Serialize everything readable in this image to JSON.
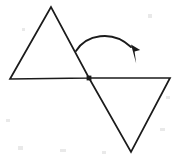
{
  "figure": {
    "background_color": "#ffffff",
    "ink_color": "#1b1b1b",
    "width": 177,
    "height": 161,
    "caption": "Two congruent triangles joined at a common vertex, with a curved arrow indicating a rotation from the upper-left triangle to the lower-right triangle.",
    "shapes": [
      {
        "name": "upper-left-triangle",
        "role": "pre-image",
        "orientation": "point-up",
        "vertices": [
          [
            51,
            7
          ],
          [
            10,
            79
          ],
          [
            89,
            78
          ]
        ],
        "path": "M 51 7 L 10 79 L 89 78 Z"
      },
      {
        "name": "lower-right-triangle",
        "role": "image",
        "orientation": "point-down",
        "vertices": [
          [
            89,
            78
          ],
          [
            170,
            78
          ],
          [
            131,
            152
          ]
        ],
        "path": "M 89 78 L 170 78 L 131 152 Z"
      }
    ],
    "pivot": {
      "name": "pivot-point",
      "label": "",
      "x": 89,
      "y": 78,
      "radius": 2.4,
      "shape": "square-dot"
    },
    "arrow": {
      "name": "rotation-arrow",
      "direction": "clockwise",
      "tail": [
        76,
        51
      ],
      "peak": [
        110,
        33
      ],
      "tip": [
        136,
        63
      ],
      "curve_path": "M 76 51 C 86 35, 112 29, 131 47",
      "head_path": "M 131.0 44.5 L 140.2 50.0 L 134.6 51.6 L 136.2 63.5 Z"
    },
    "specks": [
      {
        "x": 18,
        "y": 146,
        "w": 5,
        "h": 4
      },
      {
        "x": 60,
        "y": 149,
        "w": 6,
        "h": 3
      },
      {
        "x": 102,
        "y": 151,
        "w": 4,
        "h": 3
      },
      {
        "x": 6,
        "y": 119,
        "w": 4,
        "h": 3
      },
      {
        "x": 160,
        "y": 128,
        "w": 5,
        "h": 3
      },
      {
        "x": 148,
        "y": 14,
        "w": 4,
        "h": 4
      },
      {
        "x": 22,
        "y": 28,
        "w": 3,
        "h": 3
      },
      {
        "x": 166,
        "y": 96,
        "w": 4,
        "h": 3
      }
    ]
  }
}
